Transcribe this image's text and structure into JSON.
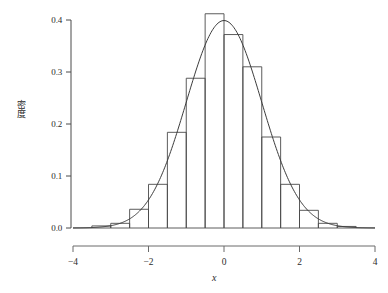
{
  "chart_data": {
    "type": "bar",
    "title": "",
    "subtitle": "",
    "xlabel": "x",
    "ylabel": "密度",
    "xlim": [
      -4,
      4
    ],
    "ylim": [
      0.0,
      0.41
    ],
    "xticks": [
      -4,
      -2,
      0,
      2,
      4
    ],
    "xtick_labels": [
      "−4",
      "−2",
      "0",
      "2",
      "4"
    ],
    "yticks": [
      0.0,
      0.1,
      0.2,
      0.3,
      0.4
    ],
    "ytick_labels": [
      "0.0",
      "0.1",
      "0.2",
      "0.3",
      "0.4"
    ],
    "grid": false,
    "legend": false,
    "legend_position": "none",
    "bin_width": 0.5,
    "bin_edges": [
      -3.5,
      -3.0,
      -2.5,
      -2.0,
      -1.5,
      -1.0,
      -0.5,
      0.0,
      0.5,
      1.0,
      1.5,
      2.0,
      2.5,
      3.0,
      3.5
    ],
    "bin_centers": [
      -3.25,
      -2.75,
      -2.25,
      -1.75,
      -1.25,
      -0.75,
      -0.25,
      0.25,
      0.75,
      1.25,
      1.75,
      2.25,
      2.75,
      3.25
    ],
    "categories": [
      "-3.25",
      "-2.75",
      "-2.25",
      "-1.75",
      "-1.25",
      "-0.75",
      "-0.25",
      "0.25",
      "0.75",
      "1.25",
      "1.75",
      "2.25",
      "2.75",
      "3.25"
    ],
    "values": [
      0.004,
      0.009,
      0.036,
      0.084,
      0.184,
      0.288,
      0.412,
      0.372,
      0.31,
      0.175,
      0.084,
      0.034,
      0.009,
      0.003
    ],
    "series": [
      {
        "name": "histogram",
        "type": "bar",
        "values": [
          0.004,
          0.009,
          0.036,
          0.084,
          0.184,
          0.288,
          0.412,
          0.372,
          0.31,
          0.175,
          0.084,
          0.034,
          0.009,
          0.003
        ]
      },
      {
        "name": "normal-density-curve",
        "type": "line",
        "distribution": "normal",
        "mean": 0.0,
        "sd": 1.0,
        "peak": 0.3989,
        "x": [
          -4.0,
          -3.6,
          -3.2,
          -2.8,
          -2.4,
          -2.0,
          -1.6,
          -1.2,
          -0.8,
          -0.4,
          0.0,
          0.4,
          0.8,
          1.2,
          1.6,
          2.0,
          2.4,
          2.8,
          3.2,
          3.6,
          4.0
        ],
        "values": [
          0.0001,
          0.0006,
          0.0024,
          0.0079,
          0.0224,
          0.054,
          0.1109,
          0.1942,
          0.2897,
          0.3683,
          0.3989,
          0.3683,
          0.2897,
          0.1942,
          0.1109,
          0.054,
          0.0224,
          0.0079,
          0.0024,
          0.0006,
          0.0001
        ]
      }
    ],
    "colors": {
      "bar_stroke": "#4a4a4a",
      "bar_fill": "none",
      "curve": "#3c3c3c",
      "axis": "#4a4a4a",
      "text": "#2b2b2b",
      "background": "#ffffff"
    }
  },
  "axes": {
    "y_axis_name": "density-axis",
    "x_axis_name": "value-axis"
  }
}
